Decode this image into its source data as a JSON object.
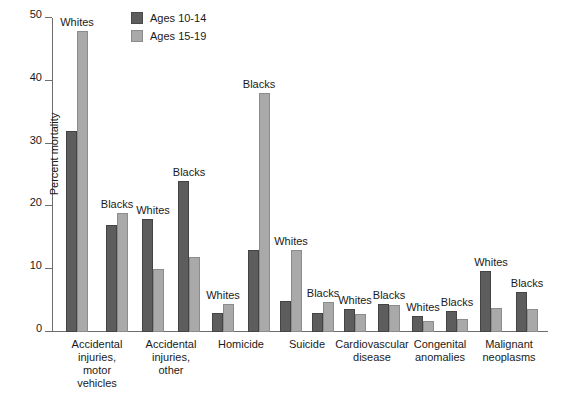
{
  "chart_data": {
    "type": "bar",
    "title": "",
    "xlabel": "",
    "ylabel": "Percent mortality",
    "ylim": [
      0,
      50
    ],
    "yticks": [
      0,
      10,
      20,
      30,
      40,
      50
    ],
    "grid": false,
    "legend_position": "top-center",
    "categories": [
      "Accidental injuries, motor vehicles",
      "Accidental injuries, other",
      "Homicide",
      "Suicide",
      "Cardiovascular disease",
      "Suicide",
      "Congenital anomalies",
      "Malignant neoplasms"
    ],
    "series": [
      {
        "name": "Ages 10-14",
        "color": "#5d5d5d"
      },
      {
        "name": "Ages 15-19",
        "color": "#a9a9a9"
      }
    ],
    "groups": [
      {
        "category": "Accidental injuries, motor vehicles",
        "lines": [
          "Accidental",
          "injuries,",
          "motor",
          "vehicles"
        ],
        "pairs": [
          {
            "race": "Whites",
            "ages_10_14": 32,
            "ages_15_19": 48
          },
          {
            "race": "Blacks",
            "ages_10_14": 17,
            "ages_15_19": 19
          }
        ]
      },
      {
        "category": "Accidental injuries, other",
        "lines": [
          "Accidental",
          "injuries,",
          "other"
        ],
        "pairs": [
          {
            "race": "Whites",
            "ages_10_14": 18,
            "ages_15_19": 10
          },
          {
            "race": "Blacks",
            "ages_10_14": 24,
            "ages_15_19": 12
          }
        ]
      },
      {
        "category": "Homicide",
        "lines": [
          "Homicide"
        ],
        "pairs": [
          {
            "race": "Whites",
            "ages_10_14": 3,
            "ages_15_19": 4.5
          },
          {
            "race": "Blacks",
            "ages_10_14": 13,
            "ages_15_19": 38
          }
        ]
      },
      {
        "category": "Suicide",
        "lines": [
          "Suicide"
        ],
        "pairs": [
          {
            "race": "Whites",
            "ages_10_14": 5,
            "ages_15_19": 13
          },
          {
            "race": "Blacks",
            "ages_10_14": 3,
            "ages_15_19": 4.7
          }
        ]
      },
      {
        "category": "Cardiovascular disease",
        "lines": [
          "Cardiovascular",
          "disease"
        ],
        "pairs": [
          {
            "race": "Whites",
            "ages_10_14": 3.7,
            "ages_15_19": 2.8
          },
          {
            "race": "Blacks",
            "ages_10_14": 4.5,
            "ages_15_19": 4.3
          }
        ]
      },
      {
        "category": "Congenital anomalies",
        "lines": [
          "Congenital",
          "anomalies"
        ],
        "pairs": [
          {
            "race": "Whites",
            "ages_10_14": 2.5,
            "ages_15_19": 1.7
          },
          {
            "race": "Blacks",
            "ages_10_14": 3.3,
            "ages_15_19": 2.0
          }
        ]
      },
      {
        "category": "Malignant neoplasms",
        "lines": [
          "Malignant",
          "neoplasms"
        ],
        "pairs": [
          {
            "race": "Whites",
            "ages_10_14": 9.7,
            "ages_15_19": 3.8
          },
          {
            "race": "Blacks",
            "ages_10_14": 6.3,
            "ages_15_19": 3.7
          }
        ]
      }
    ]
  },
  "legend": {
    "items": [
      {
        "label": "Ages 10-14",
        "swatch": "dark"
      },
      {
        "label": "Ages 15-19",
        "swatch": "light"
      }
    ]
  },
  "axis": {
    "y_title": "Percent mortality",
    "y_tick_labels": [
      "0",
      "10",
      "20",
      "30",
      "40",
      "50"
    ]
  }
}
